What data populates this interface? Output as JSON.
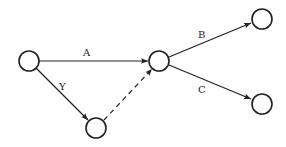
{
  "diagram": {
    "type": "directed-graph",
    "stroke_color": "#222222",
    "background": "#ffffff",
    "nodes": [
      {
        "id": "n1",
        "cx": 29,
        "cy": 61,
        "r": 10
      },
      {
        "id": "n2",
        "cx": 159,
        "cy": 61,
        "r": 10
      },
      {
        "id": "n3",
        "cx": 96,
        "cy": 128,
        "r": 10
      },
      {
        "id": "n4",
        "cx": 262,
        "cy": 19,
        "r": 10
      },
      {
        "id": "n5",
        "cx": 262,
        "cy": 104,
        "r": 10
      }
    ],
    "edges": [
      {
        "from": "n1",
        "to": "n2",
        "label": "A",
        "style": "solid"
      },
      {
        "from": "n1",
        "to": "n3",
        "label": "Y",
        "style": "solid"
      },
      {
        "from": "n3",
        "to": "n2",
        "label": "",
        "style": "dashed"
      },
      {
        "from": "n2",
        "to": "n4",
        "label": "B",
        "style": "solid"
      },
      {
        "from": "n2",
        "to": "n5",
        "label": "C",
        "style": "solid"
      }
    ],
    "labels": {
      "A": "A",
      "Y": "Y",
      "B": "B",
      "C": "C"
    }
  }
}
